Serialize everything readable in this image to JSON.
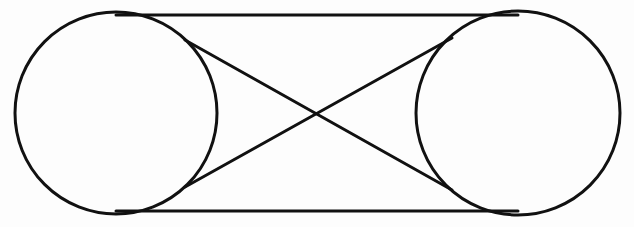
{
  "diagram": {
    "title": "",
    "type": "crossed-belt-pulley",
    "stroke_color": "#111111",
    "background_color": "#fdfdfd",
    "pulleys": [
      {
        "id": "left-pulley",
        "cx": 116,
        "cy": 113,
        "r": 101
      },
      {
        "id": "right-pulley",
        "cx": 518,
        "cy": 113,
        "r": 102
      }
    ],
    "lines": [
      {
        "id": "top-belt",
        "x1": 116,
        "y1": 15,
        "x2": 518,
        "y2": 15
      },
      {
        "id": "bottom-belt",
        "x1": 116,
        "y1": 211,
        "x2": 518,
        "y2": 211
      },
      {
        "id": "cross-belt-1",
        "x1": 185,
        "y1": 40,
        "x2": 452,
        "y2": 190
      },
      {
        "id": "cross-belt-2",
        "x1": 185,
        "y1": 187,
        "x2": 452,
        "y2": 38
      }
    ],
    "crossing_point": {
      "x": 318,
      "y": 114
    }
  }
}
